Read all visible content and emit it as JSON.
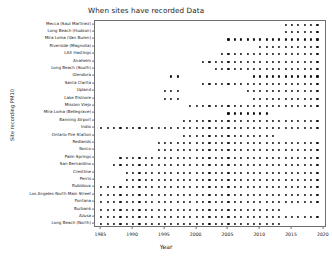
{
  "chart_data": {
    "type": "scatter",
    "title": "When sites have recorded Data",
    "xlabel": "Year",
    "ylabel": "Site recording PM10",
    "xlim": [
      1984,
      2020.5
    ],
    "xticks": [
      1985,
      1990,
      1995,
      2000,
      2005,
      2010,
      2015,
      2020
    ],
    "xtick_labels": [
      "1985",
      "1990",
      "1995",
      "2000",
      "2005",
      "2010",
      "2015",
      "2020"
    ],
    "grid": false,
    "legend": null,
    "marker": "circle",
    "marker_color": "#111111",
    "categories": [
      "Mecca (Saul Martinez)",
      "Long Beach (Hudson)",
      "Mira Loma (Van Buren)",
      "Riverside (Magnolia)",
      "LAX Hastings",
      "Anaheim",
      "Long Beach (South)",
      "Glendora",
      "Santa Clarita",
      "Upland",
      "Lake Elsinore",
      "Mission Viejo",
      "Mira Loma (Bellegrave)",
      "Banning Airport",
      "Indio",
      "Ontario Fire Station",
      "Redlands",
      "Norco",
      "Palm Springs",
      "San Bernardino",
      "Crestline",
      "Perris",
      "Rubidoux",
      "Los Angeles-North Main Street",
      "Fontana",
      "Burbank",
      "Azusa",
      "Long Beach (North)"
    ],
    "series": [
      {
        "name": "Mecca (Saul Martinez)",
        "years": [
          2014,
          2015,
          2016,
          2017,
          2018,
          2019
        ]
      },
      {
        "name": "Long Beach (Hudson)",
        "years": [
          2014,
          2015,
          2016,
          2017,
          2018,
          2019
        ]
      },
      {
        "name": "Mira Loma (Van Buren)",
        "years": [
          2005,
          2006,
          2007,
          2008,
          2009,
          2010,
          2011,
          2012,
          2013,
          2014,
          2015,
          2016,
          2017,
          2018,
          2019
        ]
      },
      {
        "name": "Riverside (Magnolia)",
        "years": [
          2010,
          2011,
          2012,
          2013,
          2014,
          2015,
          2016,
          2017,
          2018,
          2019
        ]
      },
      {
        "name": "LAX Hastings",
        "years": [
          2004,
          2005,
          2006,
          2007,
          2008,
          2009,
          2010,
          2011,
          2012,
          2013,
          2014,
          2015,
          2016,
          2017,
          2018,
          2019
        ]
      },
      {
        "name": "Anaheim",
        "years": [
          2001,
          2002,
          2003,
          2004,
          2005,
          2006,
          2007,
          2008,
          2009,
          2010,
          2011,
          2012,
          2013,
          2014,
          2015,
          2016,
          2017,
          2018,
          2019
        ]
      },
      {
        "name": "Long Beach (South)",
        "years": [
          2003,
          2004,
          2005,
          2006,
          2007,
          2008,
          2009,
          2010,
          2011,
          2012,
          2013,
          2014,
          2015,
          2016,
          2017,
          2018,
          2019
        ]
      },
      {
        "name": "Glendora",
        "years": [
          1996,
          1997,
          2009,
          2010,
          2011,
          2012,
          2013,
          2014,
          2015,
          2016,
          2017,
          2018,
          2019
        ]
      },
      {
        "name": "Santa Clarita",
        "years": [
          2001,
          2002,
          2003,
          2004,
          2005,
          2006,
          2007,
          2008,
          2009,
          2010,
          2011,
          2012,
          2013,
          2014,
          2015,
          2016,
          2017,
          2018,
          2019
        ]
      },
      {
        "name": "Upland",
        "years": [
          1995,
          1996,
          1997,
          2008,
          2009,
          2010,
          2011,
          2012,
          2013,
          2014,
          2015,
          2016,
          2017,
          2018,
          2019
        ]
      },
      {
        "name": "Lake Elsinore",
        "years": [
          1995,
          1996,
          1997,
          2009,
          2010,
          2011,
          2012,
          2013,
          2014,
          2015,
          2016,
          2017,
          2018,
          2019
        ]
      },
      {
        "name": "Mission Viejo",
        "years": [
          1999,
          2000,
          2001,
          2002,
          2003,
          2004,
          2005,
          2006,
          2007,
          2008,
          2009,
          2010,
          2011,
          2012,
          2013,
          2014,
          2015,
          2016,
          2017,
          2018,
          2019
        ]
      },
      {
        "name": "Mira Loma (Bellegrave)",
        "years": [
          2005,
          2006,
          2007,
          2008,
          2009,
          2010,
          2011
        ]
      },
      {
        "name": "Banning Airport",
        "years": [
          1998,
          1999,
          2000,
          2001,
          2002,
          2003,
          2004,
          2005,
          2006,
          2007,
          2008,
          2009,
          2010,
          2011,
          2012,
          2013,
          2014,
          2015,
          2016,
          2017,
          2018,
          2019
        ]
      },
      {
        "name": "Indio",
        "years": [
          1985,
          1986,
          1987,
          1988,
          1989,
          1990,
          1991,
          1992,
          1993,
          1994,
          1995,
          1996,
          1997,
          1998,
          1999,
          2000,
          2001,
          2002,
          2003,
          2004,
          2005,
          2006,
          2007,
          2008,
          2009,
          2010,
          2011,
          2012,
          2013,
          2014,
          2015,
          2016,
          2017,
          2018,
          2019
        ]
      },
      {
        "name": "Ontario Fire Station",
        "years": [
          1998,
          1999,
          2000,
          2001,
          2002,
          2003,
          2004,
          2005,
          2006,
          2007,
          2008,
          2009,
          2010,
          2011,
          2012
        ]
      },
      {
        "name": "Redlands",
        "years": [
          1994,
          1995,
          1996,
          1997,
          1998,
          1999,
          2000,
          2001,
          2002,
          2003,
          2004,
          2005,
          2006,
          2007,
          2008,
          2009,
          2010,
          2011,
          2012,
          2013,
          2014,
          2015,
          2016,
          2017,
          2018,
          2019
        ]
      },
      {
        "name": "Norco",
        "years": [
          1994,
          1995,
          1996,
          1997,
          1998,
          1999,
          2000,
          2001,
          2002,
          2003,
          2004,
          2005,
          2006,
          2007,
          2008,
          2009,
          2010,
          2011,
          2012,
          2013,
          2014,
          2015,
          2016,
          2017,
          2018,
          2019
        ]
      },
      {
        "name": "Palm Springs",
        "years": [
          1988,
          1989,
          1990,
          1991,
          1992,
          1993,
          1994,
          1995,
          1996,
          1997,
          1998,
          1999,
          2000,
          2001,
          2002,
          2003,
          2004,
          2005,
          2006,
          2007,
          2008,
          2009,
          2010,
          2011,
          2012,
          2013,
          2014,
          2015,
          2016,
          2017,
          2018,
          2019
        ]
      },
      {
        "name": "San Bernardino",
        "years": [
          1987,
          1988,
          1989,
          1990,
          1991,
          1992,
          1993,
          1994,
          1995,
          1996,
          1997,
          1998,
          1999,
          2000,
          2001,
          2002,
          2003,
          2004,
          2005,
          2006,
          2007,
          2008,
          2009,
          2010,
          2011,
          2012,
          2013,
          2014,
          2015,
          2016,
          2017,
          2018,
          2019
        ]
      },
      {
        "name": "Crestline",
        "years": [
          1989,
          1990,
          1991,
          1992,
          1993,
          1994,
          1995,
          1996,
          1997,
          1998,
          1999,
          2000,
          2001,
          2002,
          2003,
          2004,
          2005,
          2006,
          2007,
          2008,
          2009,
          2010,
          2011,
          2012,
          2013,
          2014,
          2015,
          2016,
          2017,
          2018,
          2019
        ]
      },
      {
        "name": "Perris",
        "years": [
          1989,
          1990,
          1991,
          1992,
          1993,
          1994,
          1995,
          1996,
          1997,
          1998,
          1999,
          2000,
          2001,
          2002,
          2003,
          2004,
          2005,
          2006,
          2007,
          2008,
          2009,
          2010,
          2011,
          2012,
          2013,
          2014,
          2015,
          2016,
          2017,
          2018,
          2019
        ]
      },
      {
        "name": "Rubidoux",
        "years": [
          1985,
          1986,
          1987,
          1988,
          1989,
          1990,
          1991,
          1992,
          1993,
          1994,
          1995,
          1996,
          1997,
          1998,
          1999,
          2000,
          2001,
          2002,
          2003,
          2004,
          2005,
          2006,
          2007,
          2008,
          2009,
          2010,
          2011,
          2012,
          2013,
          2014,
          2015,
          2016,
          2017,
          2018,
          2019
        ]
      },
      {
        "name": "Los Angeles-North Main Street",
        "years": [
          1985,
          1986,
          1987,
          1988,
          1989,
          1990,
          1991,
          1992,
          1993,
          1994,
          1995,
          1996,
          1997,
          1998,
          1999,
          2000,
          2001,
          2002,
          2003,
          2004,
          2005,
          2006,
          2007,
          2008,
          2009,
          2010,
          2011,
          2012,
          2013,
          2014,
          2015,
          2016,
          2017,
          2018,
          2019
        ]
      },
      {
        "name": "Fontana",
        "years": [
          1985,
          1986,
          1987,
          1988,
          1989,
          1990,
          1991,
          1992,
          1993,
          1994,
          1995,
          1996,
          1997,
          1998,
          1999,
          2000,
          2001,
          2002,
          2003,
          2004,
          2005,
          2006,
          2007,
          2008,
          2009,
          2010,
          2011,
          2012,
          2013,
          2014,
          2015,
          2016,
          2017,
          2018,
          2019
        ]
      },
      {
        "name": "Burbank",
        "years": [
          1985,
          1986,
          1987,
          1988,
          1989,
          1990,
          1991,
          1992,
          1993,
          1994,
          1995,
          1996,
          1997,
          1998,
          1999,
          2000,
          2001,
          2002,
          2003,
          2004,
          2005,
          2006,
          2007,
          2008,
          2009,
          2010,
          2011,
          2012,
          2013
        ]
      },
      {
        "name": "Azusa",
        "years": [
          1985,
          1986,
          1987,
          1988,
          1989,
          1990,
          1991,
          1992,
          1993,
          1994,
          1995,
          1996,
          1997,
          1998,
          1999,
          2000,
          2001,
          2002,
          2003,
          2004,
          2005,
          2006,
          2007,
          2008,
          2009,
          2010,
          2011,
          2012,
          2013,
          2014,
          2015,
          2016,
          2017,
          2018,
          2019
        ]
      },
      {
        "name": "Long Beach (North)",
        "years": [
          1985,
          1986,
          1987,
          1988,
          1989,
          1990,
          1991,
          1992,
          1993,
          1994,
          1995,
          1996,
          1997,
          1998,
          1999,
          2000,
          2001,
          2002,
          2003,
          2004,
          2005,
          2006,
          2007,
          2008,
          2009,
          2010,
          2011,
          2012,
          2013
        ]
      }
    ]
  }
}
